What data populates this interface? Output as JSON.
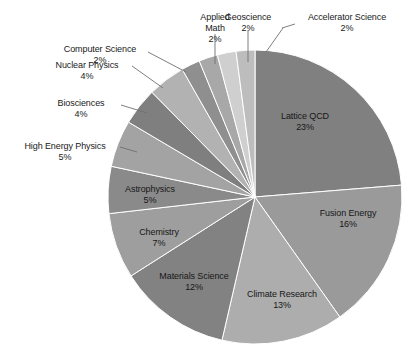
{
  "chart_data": {
    "type": "pie",
    "title": "",
    "subtitle": "",
    "xlabel": "",
    "ylabel": "",
    "legend_position": "none",
    "grid": false,
    "start_angle_deg": 0,
    "direction": "clockwise",
    "total_percent": 97,
    "categories": [
      "Lattice QCD",
      "Fusion Energy",
      "Climate Research",
      "Materials Science",
      "Chemistry",
      "Astrophysics",
      "High Energy Physics",
      "Biosciences",
      "Nuclear Physics",
      "Computer Science",
      "Applied Math",
      "Geoscience",
      "Accelerator Science"
    ],
    "values": [
      23,
      16,
      13,
      12,
      7,
      5,
      5,
      4,
      4,
      2,
      2,
      2,
      2
    ],
    "value_suffix": "%",
    "slices": [
      {
        "label": "Lattice QCD",
        "value": 23,
        "value_text": "23%",
        "color": "#808080",
        "label_placement": "inside"
      },
      {
        "label": "Fusion Energy",
        "value": 16,
        "value_text": "16%",
        "color": "#9a9a9a",
        "label_placement": "inside"
      },
      {
        "label": "Climate Research",
        "value": 13,
        "value_text": "13%",
        "color": "#adadad",
        "label_placement": "inside"
      },
      {
        "label": "Materials Science",
        "value": 12,
        "value_text": "12%",
        "color": "#828282",
        "label_placement": "inside"
      },
      {
        "label": "Chemistry",
        "value": 7,
        "value_text": "7%",
        "color": "#9e9e9e",
        "label_placement": "inside"
      },
      {
        "label": "Astrophysics",
        "value": 5,
        "value_text": "5%",
        "color": "#8a8a8a",
        "label_placement": "inside"
      },
      {
        "label": "High Energy Physics",
        "value": 5,
        "value_text": "5%",
        "color": "#a3a3a3",
        "label_placement": "outside"
      },
      {
        "label": "Biosciences",
        "value": 4,
        "value_text": "4%",
        "color": "#7f7f7f",
        "label_placement": "outside"
      },
      {
        "label": "Nuclear Physics",
        "value": 4,
        "value_text": "4%",
        "color": "#b2b2b2",
        "label_placement": "outside"
      },
      {
        "label": "Computer Science",
        "value": 2,
        "value_text": "2%",
        "color": "#8f8f8f",
        "label_placement": "outside"
      },
      {
        "label": "Applied Math",
        "value": 2,
        "value_text": "2%",
        "color": "#a8a8a8",
        "label_placement": "outside"
      },
      {
        "label": "Geoscience",
        "value": 2,
        "value_text": "2%",
        "color": "#cfcfcf",
        "label_placement": "outside"
      },
      {
        "label": "Accelerator Science",
        "value": 2,
        "value_text": "2%",
        "color": "#bdbdbd",
        "label_placement": "outside"
      }
    ],
    "geometry": {
      "center_x": 255,
      "center_y": 197,
      "radius": 147
    },
    "background_color": "#ffffff",
    "label_text_color": "#1a1a1a",
    "leader_line_color": "#6f6f6f"
  },
  "labels": {
    "lattice_qcd": {
      "name": "Lattice QCD",
      "value": "23%"
    },
    "fusion_energy": {
      "name": "Fusion Energy",
      "value": "16%"
    },
    "climate_research": {
      "name": "Climate Research",
      "value": "13%"
    },
    "materials_science": {
      "name": "Materials Science",
      "value": "12%"
    },
    "chemistry": {
      "name": "Chemistry",
      "value": "7%"
    },
    "astrophysics": {
      "name": "Astrophysics",
      "value": "5%"
    },
    "high_energy_physics": {
      "name": "High Energy Physics",
      "value": "5%"
    },
    "biosciences": {
      "name": "Biosciences",
      "value": "4%"
    },
    "nuclear_physics": {
      "name": "Nuclear Physics",
      "value": "4%"
    },
    "computer_science": {
      "name": "Computer Science",
      "value": "2%"
    },
    "applied_math_l1": {
      "name": "Applied",
      "value": "2%"
    },
    "applied_math_l2": {
      "name": "Math"
    },
    "geoscience": {
      "name": "Geoscience",
      "value": "2%"
    },
    "accelerator_science": {
      "name": "Accelerator Science",
      "value": "2%"
    }
  }
}
